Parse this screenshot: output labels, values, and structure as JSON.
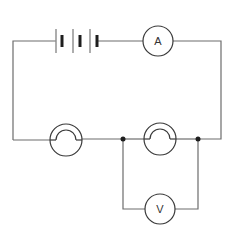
{
  "diagram": {
    "type": "electric-circuit",
    "components": {
      "battery": {
        "cells": 3
      },
      "ammeter": {
        "label": "A"
      },
      "voltmeter": {
        "label": "V"
      },
      "lamps": [
        {
          "id": "lamp-1"
        },
        {
          "id": "lamp-2"
        }
      ],
      "junctions": 2
    },
    "colors": {
      "wire": "#6d6d6d",
      "component": "#3a3a3a",
      "background": "#ffffff"
    }
  }
}
